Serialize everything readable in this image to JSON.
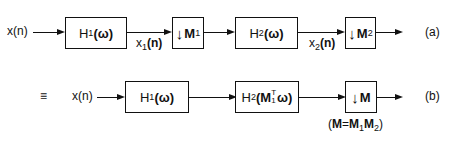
{
  "diagram": {
    "row_a": {
      "label": "(a)",
      "input": "x(n)",
      "blocks": [
        {
          "id": "H1",
          "text": "H",
          "sub": "1",
          "arg": "(ω)"
        },
        {
          "id": "M1",
          "arrow": "↓",
          "text": "M",
          "sub": "1"
        },
        {
          "id": "H2",
          "text": "H",
          "sub": "2",
          "arg": "(ω)"
        },
        {
          "id": "M2",
          "arrow": "↓",
          "text": "M",
          "sub": "2"
        }
      ],
      "signals": [
        {
          "text": "x",
          "sub": "1",
          "arg": "(n)"
        },
        {
          "text": "x",
          "sub": "2",
          "arg": "(n)"
        }
      ]
    },
    "row_b": {
      "label": "(b)",
      "equiv": "≡",
      "input": "x(n)",
      "blocks": [
        {
          "id": "H1",
          "text": "H",
          "sub": "1",
          "arg": "(ω)"
        },
        {
          "id": "H2",
          "text": "H",
          "sub": "2",
          "arg_open": "(",
          "arg_M": "M",
          "arg_sup": "T",
          "arg_sub": "1",
          "arg_w": "ω",
          "arg_close": ")"
        },
        {
          "id": "M",
          "arrow": "↓",
          "text": "M"
        }
      ],
      "note": {
        "open": "(",
        "M": "M",
        "eq": "=",
        "M1": "M",
        "s1": "1",
        "M2": "M",
        "s2": "2",
        "close": ")"
      }
    }
  }
}
